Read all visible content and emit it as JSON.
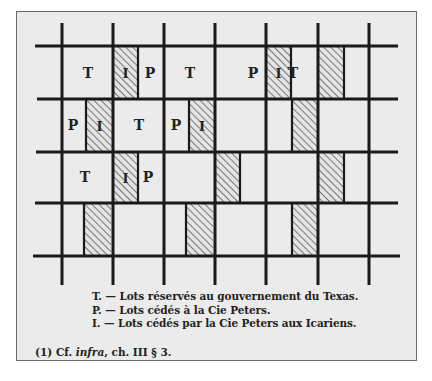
{
  "figure": {
    "frame_background": "#ebebeb",
    "line_color": "#1a1a1a",
    "hatch_color": "#3a3a3a",
    "grid": {
      "horizontal_lines": [
        {
          "y": 46,
          "x1": 35,
          "x2": 398
        },
        {
          "y": 99,
          "x1": 37,
          "x2": 398
        },
        {
          "y": 152,
          "x1": 36,
          "x2": 398
        },
        {
          "y": 203,
          "x1": 35,
          "x2": 398
        },
        {
          "y": 256,
          "x1": 33,
          "x2": 400
        }
      ],
      "vertical_lines": [
        {
          "x": 62,
          "y1": 23,
          "y2": 285
        },
        {
          "x": 113,
          "y1": 23,
          "y2": 285
        },
        {
          "x": 164,
          "y1": 23,
          "y2": 285
        },
        {
          "x": 215,
          "y1": 23,
          "y2": 285
        },
        {
          "x": 266,
          "y1": 23,
          "y2": 285
        },
        {
          "x": 318,
          "y1": 23,
          "y2": 285
        },
        {
          "x": 369,
          "y1": 23,
          "y2": 285
        }
      ]
    },
    "hatched_lots": [
      {
        "x": 113,
        "y": 46,
        "w": 25,
        "h": 53,
        "label": "I"
      },
      {
        "x": 266,
        "y": 46,
        "w": 25,
        "h": 53,
        "label": "I"
      },
      {
        "x": 318,
        "y": 46,
        "w": 26,
        "h": 53,
        "label": ""
      },
      {
        "x": 86,
        "y": 99,
        "w": 27,
        "h": 53,
        "label": "I"
      },
      {
        "x": 189,
        "y": 99,
        "w": 26,
        "h": 53,
        "label": "I"
      },
      {
        "x": 292,
        "y": 99,
        "w": 26,
        "h": 53,
        "label": ""
      },
      {
        "x": 113,
        "y": 152,
        "w": 25,
        "h": 51,
        "label": "I"
      },
      {
        "x": 215,
        "y": 152,
        "w": 25,
        "h": 51,
        "label": ""
      },
      {
        "x": 318,
        "y": 152,
        "w": 26,
        "h": 51,
        "label": ""
      },
      {
        "x": 84,
        "y": 203,
        "w": 27,
        "h": 53,
        "label": ""
      },
      {
        "x": 186,
        "y": 203,
        "w": 27,
        "h": 53,
        "label": ""
      },
      {
        "x": 292,
        "y": 203,
        "w": 26,
        "h": 53,
        "label": ""
      }
    ],
    "lot_dividers": [
      {
        "x": 138,
        "y1": 46,
        "y2": 99
      },
      {
        "x": 291,
        "y1": 46,
        "y2": 99
      },
      {
        "x": 344,
        "y1": 46,
        "y2": 99
      },
      {
        "x": 86,
        "y1": 99,
        "y2": 152
      },
      {
        "x": 189,
        "y1": 99,
        "y2": 152
      },
      {
        "x": 292,
        "y1": 99,
        "y2": 152
      },
      {
        "x": 138,
        "y1": 152,
        "y2": 203
      },
      {
        "x": 240,
        "y1": 152,
        "y2": 203
      },
      {
        "x": 344,
        "y1": 152,
        "y2": 203
      },
      {
        "x": 84,
        "y1": 203,
        "y2": 256
      },
      {
        "x": 186,
        "y1": 203,
        "y2": 256
      },
      {
        "x": 292,
        "y1": 203,
        "y2": 256
      }
    ],
    "lot_labels": [
      {
        "text": "T",
        "x": 88,
        "y": 78
      },
      {
        "text": "P",
        "x": 150,
        "y": 78
      },
      {
        "text": "T",
        "x": 190,
        "y": 78
      },
      {
        "text": "P",
        "x": 253,
        "y": 78
      },
      {
        "text": "T",
        "x": 293,
        "y": 78
      },
      {
        "text": "P",
        "x": 73,
        "y": 130
      },
      {
        "text": "T",
        "x": 139,
        "y": 130
      },
      {
        "text": "P",
        "x": 176,
        "y": 130
      },
      {
        "text": "T",
        "x": 85,
        "y": 182
      },
      {
        "text": "P",
        "x": 148,
        "y": 182
      }
    ]
  },
  "legend": [
    {
      "key": "T. —",
      "text": "Lots réservés au gouvernement du Texas."
    },
    {
      "key": "P. —",
      "text": "Lots cédés à la Cie Peters."
    },
    {
      "key": "I. —",
      "text": "Lots cédés par la Cie Peters aux Icariens."
    }
  ],
  "footnote": {
    "marker": "(1)",
    "prefix": "Cf.",
    "italic": "infra",
    "suffix": ", ch. III § 3."
  }
}
